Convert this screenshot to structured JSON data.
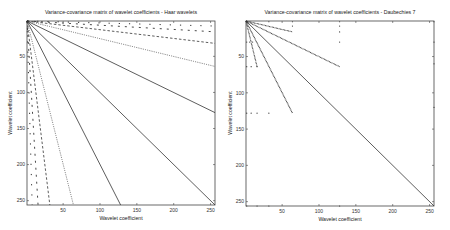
{
  "chart_data": [
    {
      "type": "line",
      "title": "Variance-covariance matrix of wavelet coefficients - Haar wavelets",
      "xlabel": "Wavelet coefficient",
      "ylabel": "Wavelet coefficient",
      "xlim": [
        1,
        256
      ],
      "ylim": [
        256,
        1
      ],
      "y_reversed": true,
      "xticks": [
        50,
        100,
        150,
        200,
        250
      ],
      "yticks": [
        50,
        100,
        150,
        200,
        250
      ],
      "grid": false,
      "series": [
        {
          "name": "diagonal",
          "style": "solid",
          "x": [
            1,
            256
          ],
          "y": [
            1,
            256
          ]
        },
        {
          "name": "scale-2-upper",
          "style": "solid",
          "x": [
            1,
            256
          ],
          "y": [
            1,
            128
          ]
        },
        {
          "name": "scale-2-lower",
          "style": "solid",
          "x": [
            1,
            128
          ],
          "y": [
            1,
            256
          ]
        },
        {
          "name": "scale-4-upper",
          "style": "dotted",
          "x": [
            1,
            256
          ],
          "y": [
            1,
            64
          ]
        },
        {
          "name": "scale-4-lower",
          "style": "dotted",
          "x": [
            1,
            64
          ],
          "y": [
            1,
            256
          ]
        },
        {
          "name": "scale-8-upper",
          "style": "dashed",
          "x": [
            1,
            256
          ],
          "y": [
            1,
            32
          ]
        },
        {
          "name": "scale-8-lower",
          "style": "dashed",
          "x": [
            1,
            32
          ],
          "y": [
            1,
            256
          ]
        },
        {
          "name": "scale-16-upper",
          "style": "sparse-dashed",
          "x": [
            1,
            256
          ],
          "y": [
            1,
            16
          ]
        },
        {
          "name": "scale-16-lower",
          "style": "sparse-dashed",
          "x": [
            1,
            16
          ],
          "y": [
            1,
            256
          ]
        },
        {
          "name": "scale-32-upper",
          "style": "sparse-dots",
          "x": [
            1,
            256
          ],
          "y": [
            1,
            8
          ]
        },
        {
          "name": "scale-32-lower",
          "style": "sparse-dots",
          "x": [
            1,
            8
          ],
          "y": [
            1,
            256
          ]
        }
      ]
    },
    {
      "type": "line",
      "title": "Variance-covariance matrix of wavelet coefficients - Daubechies 7",
      "xlabel": "Wavelet coefficient",
      "ylabel": "Wavelet coefficient",
      "xlim": [
        1,
        256
      ],
      "ylim": [
        256,
        1
      ],
      "y_reversed": true,
      "xticks": [
        50,
        100,
        150,
        200,
        250
      ],
      "yticks": [
        50,
        100,
        150,
        200,
        250
      ],
      "grid": false,
      "series": [
        {
          "name": "diagonal",
          "style": "solid",
          "x": [
            1,
            256
          ],
          "y": [
            1,
            256
          ]
        },
        {
          "name": "scale-2-upper",
          "style": "dotted-dense",
          "x": [
            1,
            128
          ],
          "y": [
            1,
            64
          ]
        },
        {
          "name": "scale-2-lower",
          "style": "dotted-dense",
          "x": [
            1,
            64
          ],
          "y": [
            1,
            128
          ]
        },
        {
          "name": "scale-4-upper",
          "style": "dotted-dense",
          "x": [
            1,
            64
          ],
          "y": [
            1,
            16
          ]
        },
        {
          "name": "scale-4-lower",
          "style": "dotted-dense",
          "x": [
            1,
            16
          ],
          "y": [
            1,
            64
          ]
        }
      ],
      "scatter_points": [
        {
          "x": 32,
          "y": 2
        },
        {
          "x": 64,
          "y": 2
        },
        {
          "x": 64,
          "y": 8
        },
        {
          "x": 128,
          "y": 2
        },
        {
          "x": 128,
          "y": 8
        },
        {
          "x": 128,
          "y": 16
        },
        {
          "x": 128,
          "y": 30
        },
        {
          "x": 256,
          "y": 2
        },
        {
          "x": 256,
          "y": 30
        },
        {
          "x": 256,
          "y": 60
        },
        {
          "x": 256,
          "y": 120
        },
        {
          "x": 2,
          "y": 30
        },
        {
          "x": 6,
          "y": 30
        },
        {
          "x": 10,
          "y": 30
        },
        {
          "x": 2,
          "y": 64
        },
        {
          "x": 8,
          "y": 64
        },
        {
          "x": 16,
          "y": 64
        },
        {
          "x": 2,
          "y": 128
        },
        {
          "x": 8,
          "y": 128
        },
        {
          "x": 16,
          "y": 128
        },
        {
          "x": 32,
          "y": 128
        },
        {
          "x": 2,
          "y": 256
        },
        {
          "x": 16,
          "y": 256
        },
        {
          "x": 32,
          "y": 256
        },
        {
          "x": 128,
          "y": 256
        }
      ]
    }
  ]
}
